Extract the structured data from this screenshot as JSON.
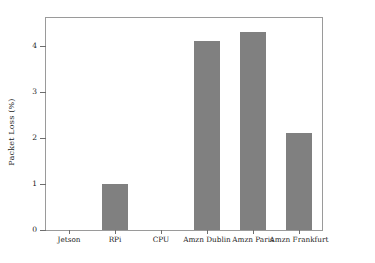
{
  "chart_data": {
    "type": "bar",
    "title": "",
    "xlabel": "",
    "ylabel": "Packet Loss (%)",
    "categories": [
      "Jetson",
      "RPi",
      "CPU",
      "Amzn Dublin",
      "Amzn Paris",
      "Amzn Frankfurt"
    ],
    "values": [
      0,
      1.0,
      0,
      4.1,
      4.3,
      2.1
    ],
    "ylim": [
      0,
      4.6
    ],
    "yticks": [
      0,
      1,
      2,
      3,
      4
    ],
    "ytick_labels": [
      "0",
      "1",
      "2",
      "3",
      "4"
    ],
    "grid": false,
    "legend": null,
    "bar_color": "#808080",
    "frame_color": "#9a9a9a",
    "background": "#ffffff"
  }
}
